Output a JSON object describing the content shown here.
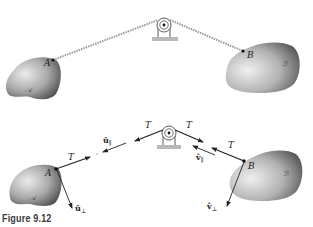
{
  "figure": {
    "caption": "Figure 9.12",
    "top_panel": {
      "point_a_label": "A",
      "point_b_label": "B",
      "body_a_label": "𝒜",
      "body_b_label": "ℬ"
    },
    "bottom_panel": {
      "tension_labels": [
        "T",
        "T",
        "T",
        "T"
      ],
      "point_a_label": "A",
      "point_b_label": "B",
      "body_a_label": "𝒜",
      "body_b_label": "ℬ",
      "u_parallel": "û",
      "u_parallel_sub": "∥",
      "u_perp": "û",
      "u_perp_sub": "⊥",
      "v_parallel": "v̂",
      "v_parallel_sub": "∥",
      "v_perp": "v̂",
      "v_perp_sub": "⊥"
    }
  },
  "colors": {
    "ink": "#222222",
    "rope": "#9a9a9a",
    "base": "#b8b8b8",
    "body_light": "#e6e6e6",
    "body_dark": "#555555"
  }
}
